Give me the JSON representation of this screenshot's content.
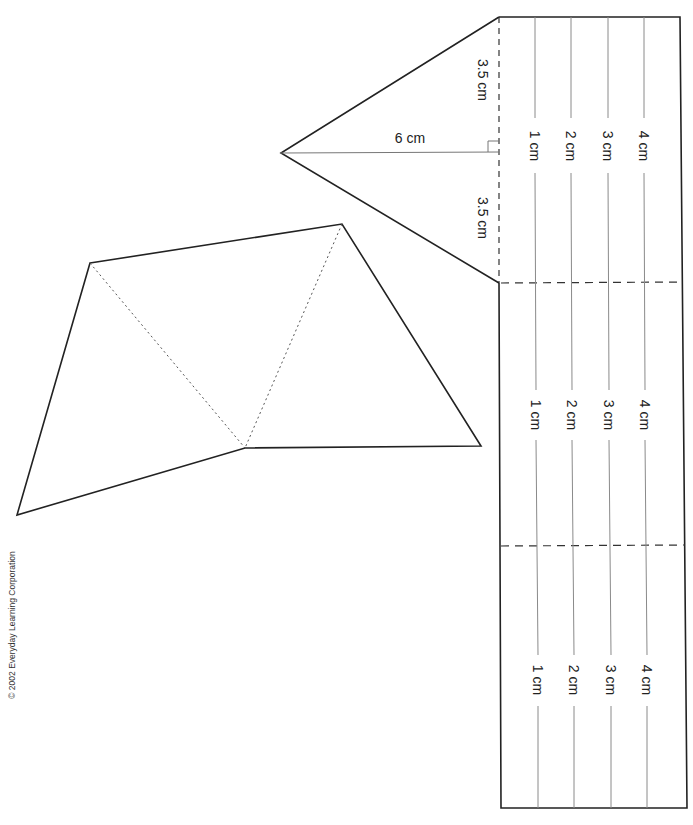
{
  "document": {
    "copyright": "© 2002 Everyday Learning Corporation",
    "triangle_cap": {
      "height_label": "6 cm",
      "half_base_top_label": "3.5 cm",
      "half_base_bottom_label": "3.5 cm"
    },
    "rectangle_sections": [
      {
        "labels": [
          "1 cm",
          "2 cm",
          "3 cm",
          "4 cm"
        ]
      },
      {
        "labels": [
          "1 cm",
          "2 cm",
          "3 cm",
          "4 cm"
        ]
      },
      {
        "labels": [
          "1 cm",
          "2 cm",
          "3 cm",
          "4 cm"
        ]
      }
    ],
    "colors": {
      "line": "#222222",
      "guide": "#888888",
      "background": "#ffffff"
    }
  }
}
